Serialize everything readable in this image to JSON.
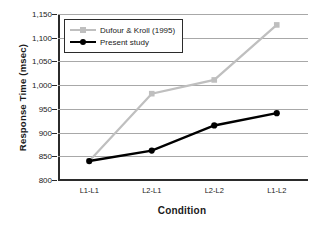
{
  "chart_data": {
    "type": "line",
    "title": "",
    "xlabel": "Condition",
    "ylabel": "Response Time (msec)",
    "categories": [
      "L1-L1",
      "L2-L1",
      "L2-L2",
      "L1-L2"
    ],
    "ylim": [
      800,
      1150
    ],
    "ytick_step": 50,
    "ytick_labels": [
      "800",
      "850",
      "900",
      "950",
      "1,000",
      "1,050",
      "1,100",
      "1,150"
    ],
    "ytick_values": [
      800,
      850,
      900,
      950,
      1000,
      1050,
      1100,
      1150
    ],
    "grid": true,
    "legend_position": "top-left",
    "series": [
      {
        "name": "Dufour & Kroll (1995)",
        "values": [
          840,
          982,
          1011,
          1127
        ],
        "color": "#bfbfbf",
        "marker": "square"
      },
      {
        "name": "Present study",
        "values": [
          840,
          862,
          915,
          941
        ],
        "color": "#000000",
        "marker": "circle"
      }
    ]
  },
  "axes": {
    "y_title": "Response Time (msec)",
    "x_title": "Condition"
  },
  "legend": {
    "entries": [
      {
        "label": "Dufour & Kroll (1995)"
      },
      {
        "label": "Present study"
      }
    ]
  }
}
